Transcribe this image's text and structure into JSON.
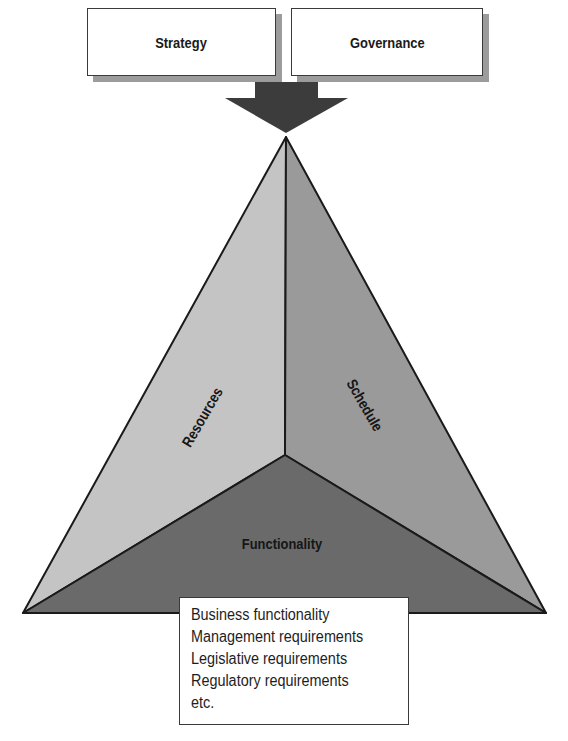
{
  "diagram": {
    "inputs": [
      {
        "id": "strategy",
        "label": "Strategy"
      },
      {
        "id": "governance",
        "label": "Governance"
      }
    ],
    "arrow": {
      "direction": "down",
      "target": "pyramid-apex"
    },
    "pyramid": {
      "faces": [
        {
          "id": "resources",
          "label": "Resources",
          "position": "left",
          "color": "#c4c4c4"
        },
        {
          "id": "schedule",
          "label": "Schedule",
          "position": "right",
          "color": "#9a9a9a"
        },
        {
          "id": "functionality",
          "label": "Functionality",
          "position": "bottom",
          "color": "#6a6a6a"
        }
      ]
    },
    "functionality_details": {
      "items": [
        "Business functionality",
        "Management requirements",
        "Legislative requirements",
        "Regulatory requirements",
        "etc."
      ]
    },
    "colors": {
      "outline": "#1a1a1a",
      "arrow": "#3c3c3c",
      "shadow": "#9c9c9c",
      "box_fill": "#ffffff"
    }
  }
}
